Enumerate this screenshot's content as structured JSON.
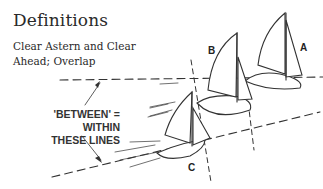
{
  "header": {
    "title": "Definitions",
    "subtitle_line1": "Clear Astern and Clear",
    "subtitle_line2": "Ahead; Overlap"
  },
  "diagram": {
    "callout_line1": "'BETWEEN' = WITHIN",
    "callout_line2": "THESE LINES",
    "boats": [
      {
        "label": "A"
      },
      {
        "label": "B"
      },
      {
        "label": "C"
      }
    ],
    "line_color": "#333333"
  }
}
